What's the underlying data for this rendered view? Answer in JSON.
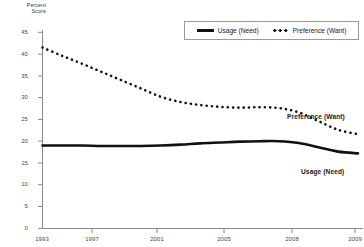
{
  "chart_data": {
    "type": "line",
    "title": "",
    "xlabel": "",
    "ylabel": "Percent\nScore",
    "ylim": [
      0,
      45
    ],
    "ytick_labels": [
      "0",
      "5",
      "10",
      "15",
      "20",
      "25",
      "30",
      "35",
      "40",
      "45"
    ],
    "ytick_values": [
      0,
      5,
      10,
      15,
      20,
      25,
      30,
      35,
      40,
      45
    ],
    "xlim": [
      1993,
      2009
    ],
    "xtick_labels": [
      "1993",
      "1997",
      "2001",
      "2005",
      "2008",
      "2009"
    ],
    "xtick_values": [
      1993,
      1997,
      2001,
      2005,
      2008,
      2009
    ],
    "grid": false,
    "legend_position": "top-right",
    "x": [
      1993,
      1994,
      1995,
      1996,
      1997,
      1998,
      1999,
      2000,
      2001,
      2002,
      2003,
      2004,
      2005,
      2006,
      2007,
      2008,
      2009
    ],
    "series": [
      {
        "name": "Usage (Need)",
        "style": "solid",
        "color": "#111111",
        "values": [
          19.0,
          19.0,
          19.0,
          18.9,
          18.9,
          18.9,
          19.0,
          19.2,
          19.5,
          19.7,
          19.9,
          20.0,
          20.0,
          19.6,
          18.6,
          17.6,
          17.2
        ]
      },
      {
        "name": "Preference (Want)",
        "style": "dotted",
        "color": "#111111",
        "values": [
          41.5,
          39.6,
          37.8,
          35.9,
          34.0,
          32.1,
          30.2,
          29.0,
          28.3,
          27.9,
          27.7,
          27.8,
          27.6,
          26.6,
          24.6,
          22.6,
          21.6
        ]
      }
    ],
    "annotations": [
      {
        "text": "Preference (Want)",
        "series": "Preference (Want)"
      },
      {
        "text": "Usage (Need)",
        "series": "Usage (Need)"
      }
    ]
  },
  "legend": {
    "items": [
      {
        "label": "Usage (Need)",
        "style": "solid"
      },
      {
        "label": "Preference (Want)",
        "style": "dotted"
      }
    ]
  }
}
